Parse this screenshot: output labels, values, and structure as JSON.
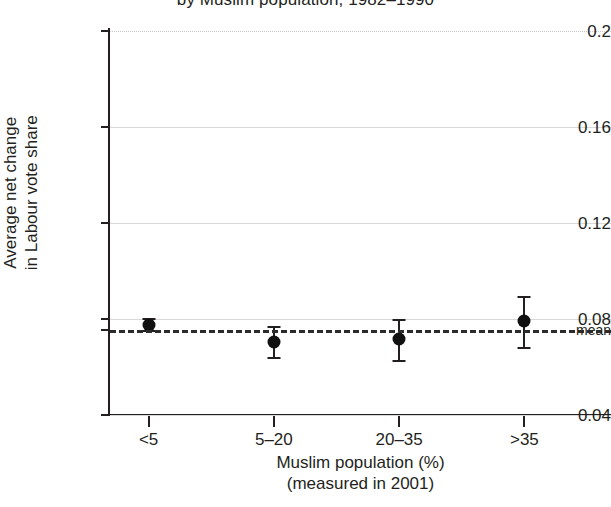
{
  "chart_data": {
    "type": "scatter",
    "title": "by Muslim population, 1982–1990",
    "xlabel_line1": "Muslim population (%)",
    "xlabel_line2": "(measured in 2001)",
    "ylabel_line1": "Average net change",
    "ylabel_line2": "in Labour vote share",
    "categories": [
      "<5",
      "5–20",
      "20–35",
      ">35"
    ],
    "values": [
      0.0775,
      0.0705,
      0.0715,
      0.079
    ],
    "error_low": [
      0.0755,
      0.064,
      0.063,
      0.0685
    ],
    "error_high": [
      0.0805,
      0.077,
      0.08,
      0.0895
    ],
    "mean": 0.0755,
    "mean_label": "mean",
    "ylim": [
      0.04,
      0.2
    ],
    "yticks": [
      0.2,
      0.16,
      0.12,
      0.08,
      0.04
    ],
    "ytick_labels": [
      "0.2",
      "0.16",
      "0.12",
      "0.08",
      "0.04"
    ],
    "grid": true,
    "legend": "none",
    "marker": "filled-circle",
    "mean_line_style": "dashed",
    "colors": {
      "marker": "#111111",
      "axis": "#231f20",
      "grid": "#d9d9d9",
      "mean_line": "#2b2b2b",
      "background": "#ffffff"
    }
  }
}
